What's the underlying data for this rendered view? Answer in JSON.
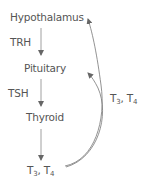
{
  "diagram": {
    "nodes": [
      {
        "id": "hypothalamus",
        "label": "Hypothalamus"
      },
      {
        "id": "pituitary",
        "label": "Pituitary"
      },
      {
        "id": "thyroid",
        "label": "Thyroid"
      },
      {
        "id": "hormones",
        "label_parts": [
          "T",
          "3",
          ", T",
          "4"
        ]
      }
    ],
    "edge_labels": {
      "hypothalamus_to_pituitary": "TRH",
      "pituitary_to_thyroid": "TSH",
      "feedback": {
        "parts": [
          "T",
          "3",
          ", T",
          "4"
        ]
      }
    },
    "colors": {
      "text": "#555555",
      "arrow": "#777777"
    }
  }
}
